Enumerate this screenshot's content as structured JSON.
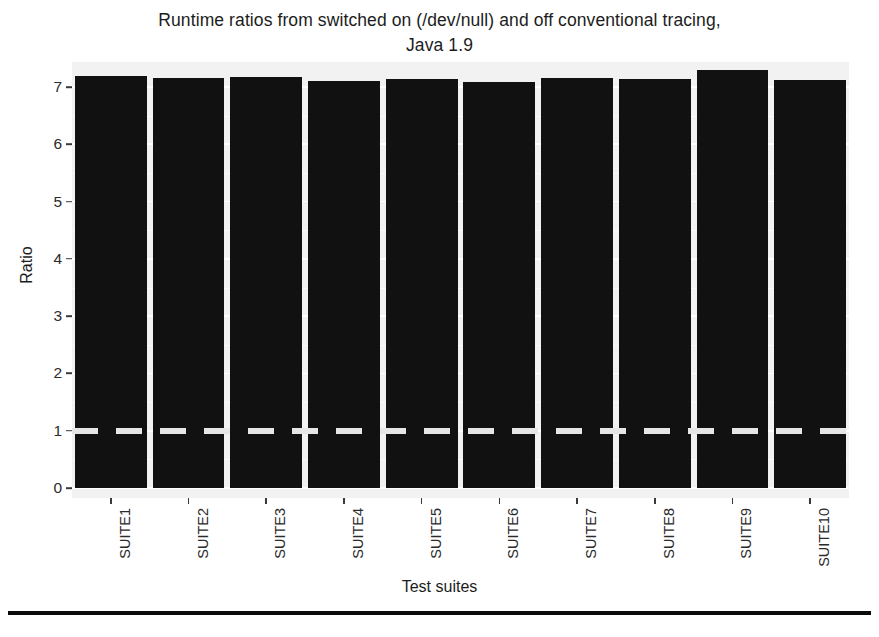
{
  "chart_data": {
    "type": "bar",
    "title": "Runtime ratios from switched on (/dev/null) and off conventional tracing, Java 1.9",
    "title_lines": [
      "Runtime ratios from switched on (/dev/null) and off conventional tracing,",
      "Java 1.9"
    ],
    "xlabel": "Test suites",
    "ylabel": "Ratio",
    "categories": [
      "SUITE1",
      "SUITE2",
      "SUITE3",
      "SUITE4",
      "SUITE5",
      "SUITE6",
      "SUITE7",
      "SUITE8",
      "SUITE9",
      "SUITE10"
    ],
    "values": [
      7.01,
      6.98,
      7.0,
      6.93,
      6.96,
      6.91,
      6.98,
      6.96,
      7.12,
      6.95
    ],
    "ylim": [
      0,
      7.45
    ],
    "xlim_note": "categorical, 10 bars",
    "yticks": [
      0,
      1,
      2,
      3,
      4,
      5,
      6,
      7
    ],
    "ytick_labels": [
      "0",
      "1",
      "2",
      "3",
      "4",
      "5",
      "6",
      "7"
    ],
    "grid": true,
    "legend": "none",
    "legend_position": "none",
    "annotations": [
      {
        "name": "reference-line",
        "type": "hline",
        "value": 1,
        "style": "dashed",
        "color": "#e6e6e6",
        "label": ""
      }
    ],
    "bar_color": "#111111",
    "panel_background": "#f2f2f2",
    "gridline_color": "#ffffff"
  },
  "colors": {
    "bar": "#111111",
    "panel": "#f2f2f2",
    "grid": "#ffffff",
    "reference_line": "#e6e6e6",
    "text": "#1c1c1c",
    "footer_rule": "#0b0b0b"
  }
}
